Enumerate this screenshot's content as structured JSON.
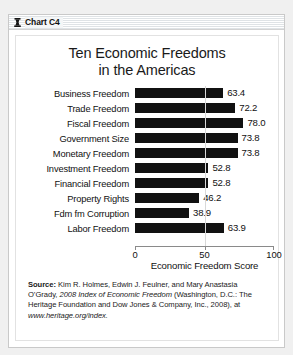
{
  "window": {
    "title": "Chart C4",
    "icon": "chart-window-icon"
  },
  "chart_data": {
    "type": "bar",
    "orientation": "horizontal",
    "title": "Ten Economic Freedoms\nin the Americas",
    "title_line1": "Ten Economic Freedoms",
    "title_line2": "in the Americas",
    "categories": [
      "Business Freedom",
      "Trade Freedom",
      "Fiscal Freedom",
      "Government Size",
      "Monetary Freedom",
      "Investment Freedom",
      "Financial Freedom",
      "Property Rights",
      "Fdm fm Corruption",
      "Labor Freedom"
    ],
    "values": [
      63.4,
      72.2,
      78.0,
      73.8,
      73.8,
      52.8,
      52.8,
      46.2,
      38.9,
      63.9
    ],
    "value_labels": [
      "63.4",
      "72.2",
      "78.0",
      "73.8",
      "73.8",
      "52.8",
      "52.8",
      "46.2",
      "38.9",
      "63.9"
    ],
    "xlabel": "Economic Freedom Score",
    "ylabel": "",
    "xlim": [
      0,
      100
    ],
    "xticks": [
      0,
      50,
      100
    ],
    "xtick_labels": [
      "0",
      "50",
      "100"
    ],
    "grid": false,
    "legend": null,
    "bar_color": "#111111"
  },
  "source": {
    "label": "Source:",
    "line1": " Kim R. Holmes, Edwin J. Feulner, and Mary Anastasia O’Grady, ",
    "italic1": "2008 Index of Economic Freedom",
    "line2": " (Washington, D.C.: The Heritage Foundation and Dow Jones & Company, Inc., 2008), at ",
    "url": "www.heritage.org/index."
  }
}
